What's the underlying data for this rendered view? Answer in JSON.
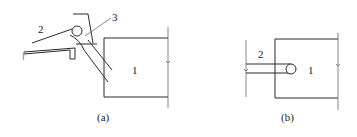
{
  "figure": {
    "panels": [
      {
        "id": "a",
        "caption": "(a)",
        "labels": {
          "body": "1",
          "part2": "2",
          "part3": "3"
        }
      },
      {
        "id": "b",
        "caption": "(b)",
        "labels": {
          "body": "1",
          "part2": "2"
        }
      }
    ],
    "colors": {
      "line": "#2a2a2a",
      "background": "#ffffff"
    }
  }
}
